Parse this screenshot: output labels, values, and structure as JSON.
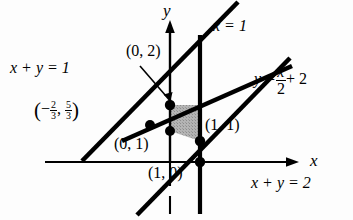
{
  "figure": {
    "background_color": "#fdfdfd",
    "line_color": "#000000",
    "shade_color": "#a8a8a8"
  },
  "axes": {
    "x_label": "x",
    "y_label": "y"
  },
  "lines": [
    {
      "name": "x-plus-y-equals-1",
      "label": "x + y = 1"
    },
    {
      "name": "x-plus-y-equals-2",
      "label": "x + y = 2"
    },
    {
      "name": "x-equals-1",
      "label": "x = 1"
    },
    {
      "name": "y-equals-half-x-plus-2",
      "label_lhs": "y =",
      "label_num": "x",
      "label_den": "2",
      "label_rhs": "+ 2"
    }
  ],
  "points": [
    {
      "name": "point-0-2",
      "label": "(0, 2)"
    },
    {
      "name": "point-0-1",
      "label": "(0, 1)"
    },
    {
      "name": "point-1-1",
      "label": "(1, 1)"
    },
    {
      "name": "point-1-0",
      "label": "(1, 0)"
    },
    {
      "name": "point-neg-two-thirds-five-thirds",
      "open_paren": "(",
      "minus": "−",
      "num1": "2",
      "den1": "3",
      "comma": ",",
      "num2": "5",
      "den2": "3",
      "close_paren": ")"
    }
  ]
}
